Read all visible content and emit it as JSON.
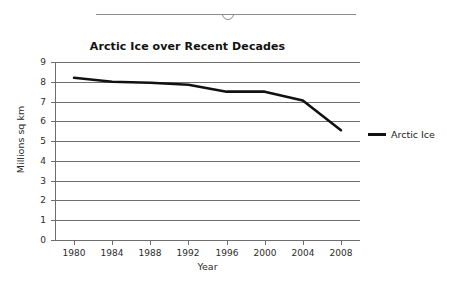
{
  "slider": {
    "name": "horizontal-slider",
    "thumb_position_percent": 50
  },
  "chart_data": {
    "type": "line",
    "title": "Arctic Ice over Recent Decades",
    "xlabel": "Year",
    "ylabel": "Millions sq km",
    "x": [
      1980,
      1984,
      1988,
      1992,
      1996,
      2000,
      2004,
      2008
    ],
    "categories": [
      "1980",
      "1984",
      "1988",
      "1992",
      "1996",
      "2000",
      "2004",
      "2008"
    ],
    "series": [
      {
        "name": "Arctic Ice",
        "values": [
          8.2,
          8.0,
          7.95,
          7.85,
          7.5,
          7.5,
          7.05,
          5.55
        ],
        "color": "#111111",
        "line_width": 2.6
      }
    ],
    "xlim": [
      1978,
      2010
    ],
    "ylim": [
      0,
      9
    ],
    "ytick_labels": [
      "9",
      "8",
      "7",
      "6",
      "5",
      "4",
      "3",
      "2",
      "1",
      "0"
    ],
    "ytick_values": [
      9,
      8,
      7,
      6,
      5,
      4,
      3,
      2,
      1,
      0
    ],
    "grid": true,
    "grid_color": "#6e6e6e",
    "legend_position": "right",
    "legend_entries": [
      "Arctic Ice"
    ]
  }
}
